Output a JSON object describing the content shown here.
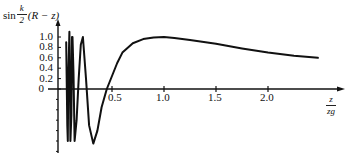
{
  "chart_data": {
    "type": "line",
    "title": "",
    "xlabel": "z / z_g",
    "ylabel": "sin (k/2)(R − z)",
    "xlabel_parts": {
      "num": "z",
      "den": "zg"
    },
    "ylabel_parts": {
      "prefix": "sin",
      "frac_num": "k",
      "frac_den": "2",
      "suffix": "(R − z)"
    },
    "x_ticks": [
      "0.5",
      "1.0",
      "1.5",
      "2.0"
    ],
    "x_tick_values": [
      0.5,
      1.0,
      1.5,
      2.0
    ],
    "y_ticks": [
      "1.0",
      "0.8",
      "0.6",
      "0.4",
      "0.2",
      "0"
    ],
    "y_tick_values": [
      1.0,
      0.8,
      0.6,
      0.4,
      0.2,
      0.0
    ],
    "xlim": [
      0,
      2.7
    ],
    "ylim": [
      -1.2,
      1.2
    ],
    "grid": false,
    "legend": null,
    "series": [
      {
        "name": "sin(k/2)(R−z)",
        "x": [
          0.06,
          0.07,
          0.075,
          0.08,
          0.09,
          0.095,
          0.1,
          0.11,
          0.115,
          0.12,
          0.13,
          0.14,
          0.16,
          0.18,
          0.2,
          0.22,
          0.25,
          0.28,
          0.32,
          0.36,
          0.4,
          0.45,
          0.5,
          0.55,
          0.6,
          0.7,
          0.8,
          0.9,
          1.0,
          1.1,
          1.25,
          1.5,
          1.75,
          2.0,
          2.25,
          2.48
        ],
        "values": [
          0.9,
          -0.7,
          -1.0,
          0.2,
          1.1,
          0.4,
          -1.0,
          -0.5,
          1.0,
          1.0,
          0.3,
          -1.0,
          -0.6,
          0.2,
          0.85,
          1.0,
          0.2,
          -0.7,
          -1.05,
          -0.8,
          -0.35,
          0.0,
          0.25,
          0.5,
          0.7,
          0.88,
          0.96,
          0.99,
          1.0,
          0.98,
          0.94,
          0.87,
          0.78,
          0.7,
          0.64,
          0.6
        ]
      }
    ],
    "annotations": []
  },
  "axis_labels": {
    "y_prefix": "sin",
    "y_frac_num": "k",
    "y_frac_den": "2",
    "y_suffix": "(R − z)",
    "x_num": "z",
    "x_den": "zg"
  }
}
